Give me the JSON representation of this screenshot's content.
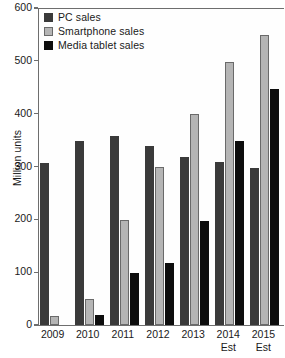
{
  "chart_data": {
    "type": "bar",
    "title": "",
    "xlabel": "",
    "ylabel": "Million units",
    "ylim": [
      0,
      600
    ],
    "yticks": [
      0,
      100,
      200,
      300,
      400,
      500,
      600
    ],
    "grid": false,
    "legend_position": "top-left",
    "categories": [
      "2009",
      "2010",
      "2011",
      "2012",
      "2013",
      "2014",
      "2015"
    ],
    "category_sublabels": [
      "",
      "",
      "",
      "",
      "",
      "Est",
      "Est"
    ],
    "series": [
      {
        "name": "PC sales",
        "color": "#3a3a3a",
        "values": [
          306,
          348,
          358,
          339,
          318,
          309,
          297
        ]
      },
      {
        "name": "Smartphone sales",
        "color": "#b5b5b5",
        "values": [
          18,
          50,
          199,
          299,
          399,
          497,
          548
        ]
      },
      {
        "name": "Media tablet sales",
        "color": "#0d0d0d",
        "values": [
          0,
          19,
          98,
          118,
          197,
          349,
          447
        ]
      }
    ]
  }
}
